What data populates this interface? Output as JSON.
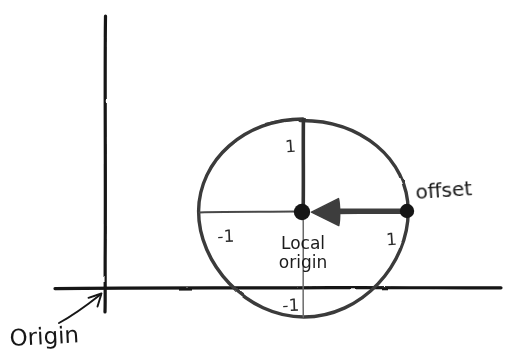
{
  "diagram": {
    "style": "hand-drawn sketch",
    "background_color": "#ffffff",
    "ink_color": "#1c1c1c",
    "labels": {
      "origin": "Origin",
      "offset": "offset",
      "local_origin_line1": "Local",
      "local_origin_line2": "origin"
    },
    "ticks": {
      "top": "1",
      "right": "1",
      "left": "-1",
      "bottom": "-1"
    },
    "global_axes": {
      "vertical_x": 105,
      "vertical_y_top": 16,
      "vertical_y_bottom": 312,
      "horizontal_y": 288,
      "horizontal_x_left": 55,
      "horizontal_x_right": 501,
      "stroke_width": 3.2,
      "color": "#141414"
    },
    "circle": {
      "center_x": 303,
      "center_y": 211,
      "radius": 105,
      "stroke_width": 3.4,
      "color": "#3a3a3a"
    },
    "local_axes": {
      "vertical_x": 303,
      "horizontal_y": 211,
      "thin_stroke_width": 1.6,
      "thick_stroke_width": 4.2
    },
    "points": [
      {
        "name": "local-origin-dot",
        "x": 302,
        "y": 212,
        "radius": 8,
        "color": "#171717"
      },
      {
        "name": "offset-dot",
        "x": 407,
        "y": 211,
        "radius": 7,
        "color": "#171717"
      }
    ],
    "offset_arrow": {
      "from_x": 407,
      "from_y": 211,
      "to_x": 311,
      "to_y": 212,
      "shaft_width": 5.5,
      "head_length": 26,
      "head_half_height": 13,
      "color": "#3d3d3d"
    },
    "origin_arrow": {
      "start_x": 60,
      "start_y": 322,
      "end_x": 101,
      "end_y": 294,
      "color": "#141414"
    },
    "label_positions": {
      "origin_x": 10,
      "origin_y": 345,
      "offset_x": 417,
      "offset_y": 198,
      "local_x": 303,
      "local_y1": 248,
      "local_y2": 267,
      "tick_top_x": 291,
      "tick_top_y": 150,
      "tick_right_x": 392,
      "tick_right_y": 244,
      "tick_left_x": 227,
      "tick_left_y": 241,
      "tick_bottom_x": 292,
      "tick_bottom_y": 310
    }
  }
}
